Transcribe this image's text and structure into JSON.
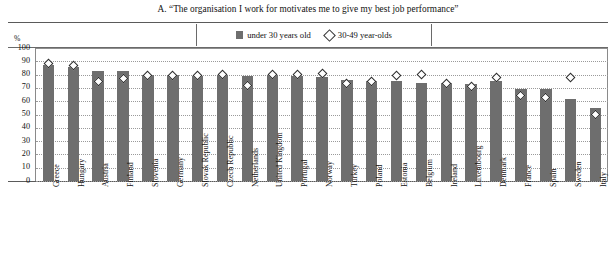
{
  "figure": {
    "title": "A. “The organisation I work for motivates me to give my best job performance”",
    "unit_label": "%"
  },
  "legend": {
    "items": [
      {
        "label": "under 30 years old",
        "marker": "filled-square",
        "color": "#6e6e6e"
      },
      {
        "label": "30-49 year-olds",
        "marker": "open-diamond",
        "color": "#ffffff"
      }
    ]
  },
  "colors": {
    "bar": "#6e6e6e",
    "marker_fill": "#ffffff",
    "marker_stroke": "#2b2b2b",
    "grid": "#9a9a9a",
    "axis": "#5a5a5a",
    "text": "#111111",
    "background": "#ffffff"
  },
  "chart_data": {
    "type": "bar",
    "title": "A. “The organisation I work for motivates me to give my best job performance”",
    "xlabel": "",
    "ylabel": "%",
    "ylim": [
      0,
      100
    ],
    "yticks": [
      0,
      10,
      20,
      30,
      40,
      50,
      60,
      70,
      80,
      90,
      100
    ],
    "grid": true,
    "legend_position": "top-center",
    "categories": [
      "Greece",
      "Hungary",
      "Austria",
      "Finland",
      "Slovenia",
      "Germany",
      "Slovak Republic",
      "Czech Republic",
      "Netherlands",
      "United Kingdom",
      "Portugal",
      "Norway",
      "Turkey",
      "Poland",
      "Estonia",
      "Belgium",
      "Ireland",
      "Luxembourg",
      "Denmark",
      "France",
      "Spain",
      "Sweden",
      "Italy"
    ],
    "series": [
      {
        "name": "under 30 years old",
        "type": "bar",
        "values": [
          87,
          86,
          83,
          83,
          80,
          80,
          79,
          80,
          79,
          80,
          79,
          78,
          76,
          75,
          75,
          74,
          74,
          73,
          75,
          69,
          69,
          62,
          55
        ]
      },
      {
        "name": "30-49 year-olds",
        "type": "scatter",
        "values": [
          88,
          87,
          75,
          77,
          79,
          79,
          79,
          80,
          72,
          80,
          80,
          81,
          73,
          75,
          79,
          80,
          73,
          71,
          78,
          64,
          63,
          78,
          50
        ]
      }
    ]
  }
}
